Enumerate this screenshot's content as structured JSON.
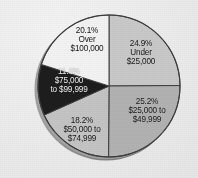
{
  "chart_data": {
    "type": "pie",
    "title": "",
    "subtitle": "",
    "xlabel": "",
    "ylabel": "",
    "grid": false,
    "legend": "none",
    "labels_inside": true,
    "start_angle_deg": 0,
    "direction": "clockwise",
    "categories": [
      "Under $25,000",
      "$25,000 to $49,999",
      "$50,000 to $74,999",
      "$75,000 to $99,999",
      "Over $100,000"
    ],
    "values": [
      24.9,
      25.2,
      18.2,
      11.6,
      20.1
    ],
    "units": "percent",
    "slices": [
      {
        "pct_text": "24.9%",
        "line1": "Under",
        "line2": "$25,000",
        "value": 24.9,
        "color": "#c9c9c9",
        "text_color": "#141414",
        "start_deg": 0,
        "end_deg": 89.64
      },
      {
        "pct_text": "25.2%",
        "line1": "$25,000 to",
        "line2": "$49,999",
        "value": 25.2,
        "color": "#b2b2b2",
        "text_color": "#141414",
        "start_deg": 89.64,
        "end_deg": 180.36
      },
      {
        "pct_text": "18.2%",
        "line1": "$50,000 to",
        "line2": "$74,999",
        "value": 18.2,
        "color": "#c4c4c4",
        "text_color": "#141414",
        "start_deg": 180.36,
        "end_deg": 245.88
      },
      {
        "pct_text": "11.6%",
        "line1": "$75,000",
        "line2": "to $99,999",
        "value": 11.6,
        "color": "#1d1d1d",
        "text_color": "#f2f2f2",
        "start_deg": 245.88,
        "end_deg": 287.64
      },
      {
        "pct_text": "20.1%",
        "line1": "Over",
        "line2": "$100,000",
        "value": 20.1,
        "color": "#f3f3f3",
        "text_color": "#141414",
        "start_deg": 287.64,
        "end_deg": 360
      }
    ],
    "total": 100.0
  },
  "style": {
    "background": "#efefef",
    "outline": "#3d3d3d",
    "shadow": "#8f8f8f"
  }
}
